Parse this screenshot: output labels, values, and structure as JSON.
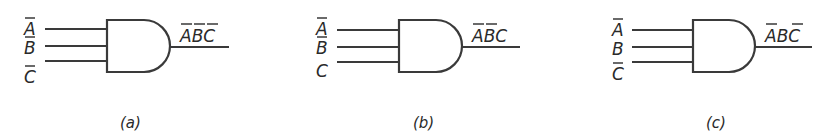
{
  "figure": {
    "gates": [
      {
        "id": "a",
        "type": "AND",
        "inputs": [
          {
            "var": "A",
            "negated": true
          },
          {
            "var": "B",
            "negated": true
          },
          {
            "var": "C",
            "negated": true
          }
        ],
        "output": {
          "text": "ABC",
          "negated": [
            true,
            true,
            true
          ]
        },
        "caption": "(a)"
      },
      {
        "id": "b",
        "type": "AND",
        "inputs": [
          {
            "var": "A",
            "negated": true
          },
          {
            "var": "B",
            "negated": true
          },
          {
            "var": "C",
            "negated": false
          }
        ],
        "output": {
          "text": "ABC",
          "negated": [
            true,
            true,
            false
          ]
        },
        "caption": "(b)"
      },
      {
        "id": "c",
        "type": "AND",
        "inputs": [
          {
            "var": "A",
            "negated": true
          },
          {
            "var": "B",
            "negated": false
          },
          {
            "var": "C",
            "negated": true
          }
        ],
        "output": {
          "text": "ABC",
          "negated": [
            true,
            false,
            true
          ]
        },
        "caption": "(c)"
      }
    ]
  }
}
